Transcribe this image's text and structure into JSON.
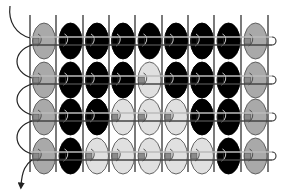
{
  "diagram": {
    "type": "bead-loom-pattern",
    "rows": 4,
    "columns": 9,
    "colors": {
      "G": "#a9a9a9",
      "B": "#000000",
      "L": "#e0e0e0",
      "outline": "#555555",
      "warp": "#333333",
      "thread": "#444444"
    },
    "legend": {
      "G": "gray edge bead",
      "B": "black bead",
      "L": "light gray bead"
    },
    "pattern": [
      [
        "G",
        "B",
        "B",
        "B",
        "B",
        "B",
        "B",
        "B",
        "G"
      ],
      [
        "G",
        "B",
        "B",
        "B",
        "L",
        "B",
        "B",
        "B",
        "G"
      ],
      [
        "G",
        "B",
        "B",
        "L",
        "L",
        "L",
        "B",
        "B",
        "G"
      ],
      [
        "G",
        "B",
        "L",
        "L",
        "L",
        "L",
        "L",
        "B",
        "G"
      ]
    ],
    "arrows": {
      "start": "thread-entry-arrow (top-left, curving into row 1)",
      "end": "thread-exit-arrow (bottom-left, pointing down)"
    }
  }
}
